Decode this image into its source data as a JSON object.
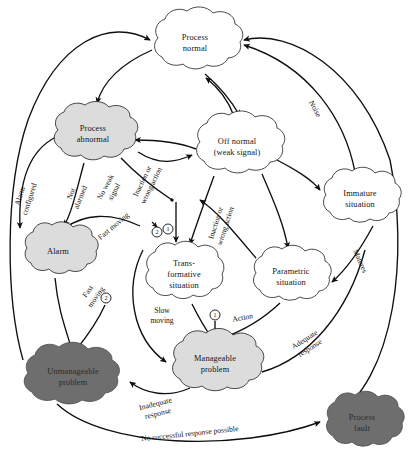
{
  "diagram": {
    "colors": {
      "white_cloud": "#ffffff",
      "light_cloud": "#dcdcdc",
      "dark_cloud": "#6e6e6e",
      "stroke": "#0f0f0f",
      "text": "#141414"
    },
    "nodes": [
      {
        "id": "process_normal",
        "label_lines": [
          "Process",
          "normal"
        ],
        "fill": "white",
        "cx": 195,
        "cy": 43,
        "rx": 47,
        "ry": 30
      },
      {
        "id": "process_abnormal",
        "label_lines": [
          "Process",
          "abnormal"
        ],
        "fill": "light",
        "cx": 93,
        "cy": 134,
        "rx": 44,
        "ry": 29
      },
      {
        "id": "off_normal",
        "label_lines": [
          "Off normal",
          "(weak signal)"
        ],
        "fill": "white",
        "cx": 237,
        "cy": 147,
        "rx": 47,
        "ry": 30
      },
      {
        "id": "immature_situation",
        "label_lines": [
          "Immature",
          "situation"
        ],
        "fill": "white",
        "cx": 360,
        "cy": 199,
        "rx": 43,
        "ry": 28
      },
      {
        "id": "alarm",
        "label_lines": [
          "Alarm"
        ],
        "fill": "light",
        "cx": 58,
        "cy": 251,
        "rx": 40,
        "ry": 26
      },
      {
        "id": "transformative",
        "label_lines": [
          "Trans-",
          "formative",
          "situation"
        ],
        "fill": "white",
        "cx": 184,
        "cy": 274,
        "rx": 42,
        "ry": 30
      },
      {
        "id": "parametric",
        "label_lines": [
          "Parametric",
          "situation"
        ],
        "fill": "white",
        "cx": 291,
        "cy": 277,
        "rx": 43,
        "ry": 27
      },
      {
        "id": "manageable_problem",
        "label_lines": [
          "Manageable",
          "problem"
        ],
        "fill": "light",
        "cx": 215,
        "cy": 364,
        "rx": 49,
        "ry": 30
      },
      {
        "id": "unmanageable_problem",
        "label_lines": [
          "Unmanageable",
          "problem"
        ],
        "fill": "dark",
        "cx": 73,
        "cy": 377,
        "rx": 53,
        "ry": 29
      },
      {
        "id": "process_fault",
        "label_lines": [
          "Process",
          "fault"
        ],
        "fill": "dark",
        "cx": 362,
        "cy": 423,
        "rx": 42,
        "ry": 27
      }
    ],
    "edge_labels": [
      {
        "id": "alarm_configured",
        "lines": [
          "Alarm",
          "configured"
        ],
        "x": 26,
        "y": 198,
        "rotate": -72
      },
      {
        "id": "not_alarmed",
        "lines": [
          "Not",
          "alarmed"
        ],
        "x": 77,
        "y": 196,
        "rotate": -68
      },
      {
        "id": "no_weak_signal",
        "lines": [
          "No weak",
          "signal"
        ],
        "x": 110,
        "y": 190,
        "rotate": -62
      },
      {
        "id": "inaction_wrong_action_1",
        "lines": [
          "Inaction or",
          "wrong action"
        ],
        "x": 146,
        "y": 185,
        "rotate": -64
      },
      {
        "id": "fast_moving_top",
        "lines": [
          "Fast moving"
        ],
        "x": 115,
        "y": 228,
        "rotate": -40
      },
      {
        "id": "fast_moving_alarm",
        "lines": [
          "Fast",
          "moving"
        ],
        "x": 93,
        "y": 295,
        "rotate": -55
      },
      {
        "id": "inaction_wrong_action_2",
        "lines": [
          "Inaction or",
          "wrong action"
        ],
        "x": 222,
        "y": 225,
        "rotate": -72
      },
      {
        "id": "noise",
        "lines": [
          "Noise"
        ],
        "x": 313,
        "y": 110,
        "rotate": 62
      },
      {
        "id": "matures",
        "lines": [
          "Matures"
        ],
        "x": 358,
        "y": 262,
        "rotate": 66
      },
      {
        "id": "slow_moving",
        "lines": [
          "Slow",
          "moving"
        ],
        "x": 162,
        "y": 315,
        "rotate": 0
      },
      {
        "id": "action",
        "lines": [
          "Action"
        ],
        "x": 235,
        "y": 322,
        "rotate": -8
      },
      {
        "id": "adequate_response",
        "lines": [
          "Adequate",
          "response"
        ],
        "x": 308,
        "y": 345,
        "rotate": -32
      },
      {
        "id": "inadequate_response",
        "lines": [
          "Inadequate",
          "response"
        ],
        "x": 155,
        "y": 412,
        "rotate": -14
      },
      {
        "id": "no_successful_response",
        "lines": [
          "No successful response possible"
        ],
        "x": 188,
        "y": 437,
        "rotate": -6
      }
    ],
    "numbered_markers": [
      {
        "id": "marker-2-top",
        "label": "2",
        "cx": 157,
        "cy": 232,
        "r": 5
      },
      {
        "id": "marker-1-top",
        "label": "1",
        "cx": 168,
        "cy": 229,
        "r": 5
      },
      {
        "id": "marker-2-alarm",
        "label": "2",
        "cx": 106,
        "cy": 298,
        "r": 5
      },
      {
        "id": "marker-1-mid",
        "label": "1",
        "cx": 215,
        "cy": 315,
        "r": 5
      }
    ]
  }
}
